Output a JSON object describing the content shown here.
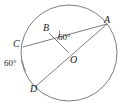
{
  "figure": {
    "type": "circle-geometry-diagram",
    "background_color": "#ffffff",
    "stroke_color": "#6e6e6e",
    "text_color": "#1a1a1a"
  },
  "circle": {
    "name": "circle-O",
    "center_x": 69,
    "center_y": 53,
    "radius": 48
  },
  "points": {
    "A": {
      "label": "A",
      "x": 107,
      "y": 24,
      "on_circle": true
    },
    "B": {
      "label": "B",
      "x": 49,
      "y": 33,
      "on_circle": false
    },
    "C": {
      "label": "C",
      "x": 23,
      "y": 47,
      "on_circle": true
    },
    "D": {
      "label": "D",
      "x": 35,
      "y": 87,
      "on_circle": true
    },
    "O": {
      "label": "O",
      "x": 69,
      "y": 53,
      "on_circle": false,
      "is_center": true
    }
  },
  "segments": [
    {
      "name": "chord-CA",
      "from": "C",
      "to": "A"
    },
    {
      "name": "diameter-DA",
      "from": "D",
      "to": "A"
    },
    {
      "name": "segment-BO",
      "from": "B",
      "to": "O"
    }
  ],
  "angles": {
    "at_B": {
      "label": "60°",
      "value": 60,
      "unit": "degrees",
      "vertex": "B",
      "rays": [
        "A",
        "O"
      ]
    },
    "exterior_left": {
      "label": "60°",
      "value": 60,
      "unit": "degrees"
    }
  }
}
